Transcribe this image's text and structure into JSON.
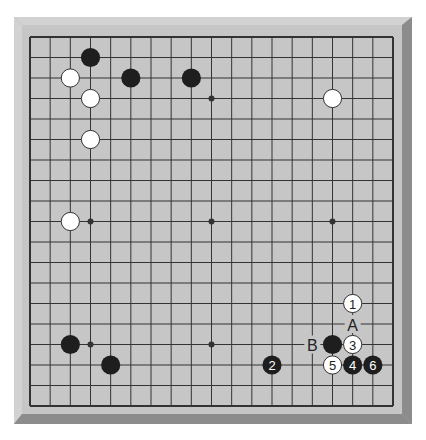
{
  "board": {
    "size": 19,
    "colors": {
      "frame_light": "#d2d2d2",
      "frame_mid": "#b4b4b4",
      "frame_dark": "#8c8c8c",
      "surface": "#c6c6c6",
      "line": "#333333",
      "black_stone": "#1e1e1e",
      "white_stone": "#ffffff",
      "white_stroke": "#333333"
    },
    "star_points": [
      [
        3,
        3
      ],
      [
        9,
        3
      ],
      [
        15,
        3
      ],
      [
        3,
        9
      ],
      [
        9,
        9
      ],
      [
        15,
        9
      ],
      [
        3,
        15
      ],
      [
        9,
        15
      ],
      [
        15,
        15
      ]
    ],
    "stones": [
      {
        "col": 3,
        "row": 1,
        "color": "black",
        "label": ""
      },
      {
        "col": 2,
        "row": 2,
        "color": "white",
        "label": ""
      },
      {
        "col": 5,
        "row": 2,
        "color": "black",
        "label": ""
      },
      {
        "col": 8,
        "row": 2,
        "color": "black",
        "label": ""
      },
      {
        "col": 3,
        "row": 3,
        "color": "white",
        "label": ""
      },
      {
        "col": 15,
        "row": 3,
        "color": "white",
        "label": ""
      },
      {
        "col": 3,
        "row": 5,
        "color": "white",
        "label": ""
      },
      {
        "col": 2,
        "row": 9,
        "color": "white",
        "label": ""
      },
      {
        "col": 2,
        "row": 15,
        "color": "black",
        "label": ""
      },
      {
        "col": 4,
        "row": 16,
        "color": "black",
        "label": ""
      },
      {
        "col": 16,
        "row": 13,
        "color": "white",
        "label": "1"
      },
      {
        "col": 12,
        "row": 16,
        "color": "black",
        "label": "2"
      },
      {
        "col": 16,
        "row": 15,
        "color": "white",
        "label": "3"
      },
      {
        "col": 16,
        "row": 16,
        "color": "black",
        "label": "4"
      },
      {
        "col": 15,
        "row": 16,
        "color": "white",
        "label": "5"
      },
      {
        "col": 17,
        "row": 16,
        "color": "black",
        "label": "6"
      },
      {
        "col": 15,
        "row": 15,
        "color": "black",
        "label": ""
      }
    ],
    "markers": [
      {
        "col": 16,
        "row": 14,
        "text": "A"
      },
      {
        "col": 14,
        "row": 15,
        "text": "B"
      }
    ]
  }
}
